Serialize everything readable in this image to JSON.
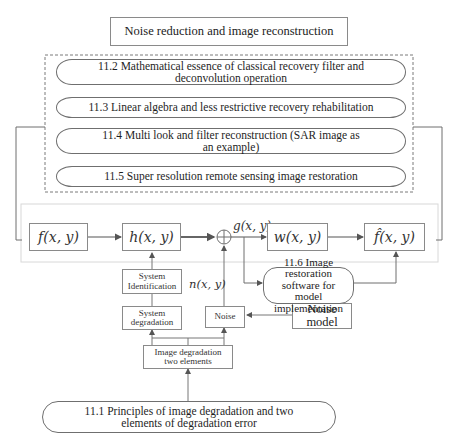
{
  "title": "Noise reduction and image reconstruction",
  "sections": [
    {
      "id": "11.1",
      "label": "11.1 Principles of image degradation and two elements of degradation error"
    },
    {
      "id": "11.2",
      "label": "11.2 Mathematical essence of classical recovery filter and deconvolution operation"
    },
    {
      "id": "11.3",
      "label": "11.3 Linear algebra and less restrictive recovery rehabilitation"
    },
    {
      "id": "11.4",
      "label": "11.4 Multi look and filter reconstruction (SAR image as an example)"
    },
    {
      "id": "11.5",
      "label": "11.5 Super resolution remote sensing image restoration"
    },
    {
      "id": "11.6",
      "label": "11.6 Image restoration software for model implementation"
    }
  ],
  "pipeline": {
    "input": "f(x, y)",
    "degradation": "h(x, y)",
    "sum_symbol": "+",
    "degraded": "g(x, y)",
    "filter": "w(x, y)",
    "output": "f̂(x, y)",
    "noise_signal": "n(x, y)"
  },
  "blocks": {
    "system_identification": "System Identification",
    "system_degradation": "System degradation",
    "noise": "Noise",
    "noise_model": "Noise model",
    "two_elements": "Image degradation two elements"
  },
  "colors": {
    "line": "#6f6f6f",
    "dashed_border": "#7a7a7a",
    "panel_border": "#d8d8d8"
  }
}
